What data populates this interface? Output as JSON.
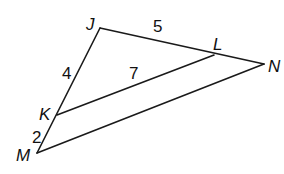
{
  "diagram": {
    "type": "triangle-with-parallel-segment",
    "vertices": [
      {
        "id": "J",
        "label": "J",
        "x": 100,
        "y": 28,
        "lx": 86,
        "ly": 30
      },
      {
        "id": "L",
        "label": "L",
        "x": 214,
        "y": 55,
        "lx": 213,
        "ly": 50
      },
      {
        "id": "N",
        "label": "N",
        "x": 264,
        "y": 64,
        "lx": 268,
        "ly": 72
      },
      {
        "id": "K",
        "label": "K",
        "x": 57,
        "y": 115,
        "lx": 39,
        "ly": 120
      },
      {
        "id": "M",
        "label": "M",
        "x": 37,
        "y": 153,
        "lx": 16,
        "ly": 161
      }
    ],
    "segments": [
      {
        "from": "J",
        "to": "N"
      },
      {
        "from": "J",
        "to": "M"
      },
      {
        "from": "M",
        "to": "N"
      },
      {
        "from": "K",
        "to": "L"
      }
    ],
    "measures": [
      {
        "segment": "JL",
        "value": "5",
        "x": 153,
        "y": 32
      },
      {
        "segment": "JK",
        "value": "4",
        "x": 62,
        "y": 79
      },
      {
        "segment": "KL",
        "value": "7",
        "x": 129,
        "y": 79
      },
      {
        "segment": "KM",
        "value": "2",
        "x": 32,
        "y": 143
      }
    ]
  }
}
